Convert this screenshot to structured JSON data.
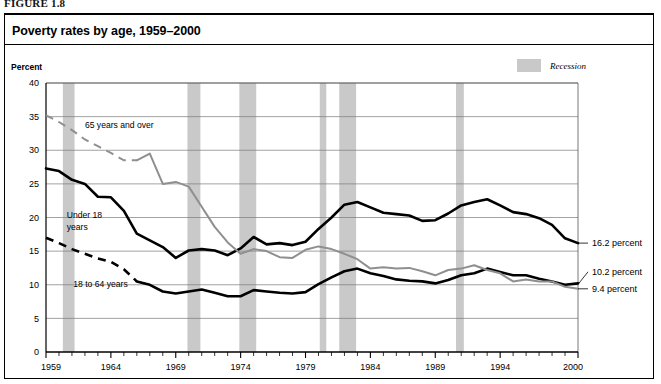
{
  "figure": {
    "label": "FIGURE 1.8"
  },
  "chart_panel": {
    "title": "Poverty rates by age, 1959–2000",
    "y_axis_title": "Percent",
    "legend": {
      "swatch_color": "#c9c9c9",
      "label": "Recession"
    }
  },
  "chart_data": {
    "type": "line",
    "title": "Poverty rates by age, 1959–2000",
    "xlabel": "",
    "ylabel": "Percent",
    "xlim": [
      1959,
      2000
    ],
    "ylim": [
      0,
      40
    ],
    "ytick_labels": [
      "0",
      "5",
      "10",
      "15",
      "20",
      "25",
      "30",
      "35",
      "40"
    ],
    "yticks": [
      0,
      5,
      10,
      15,
      20,
      25,
      30,
      35,
      40
    ],
    "xtick_labels": [
      "1959",
      "1964",
      "1969",
      "1974",
      "1979",
      "1984",
      "1989",
      "1994",
      "2000"
    ],
    "xticks": [
      1959,
      1964,
      1969,
      1974,
      1979,
      1984,
      1989,
      1994,
      2000
    ],
    "minor_xticks_every": 1,
    "grid": "horizontal",
    "legend_position": "top-right",
    "x": [
      1959,
      1960,
      1961,
      1962,
      1963,
      1964,
      1965,
      1966,
      1967,
      1968,
      1969,
      1970,
      1971,
      1972,
      1973,
      1974,
      1975,
      1976,
      1977,
      1978,
      1979,
      1980,
      1981,
      1982,
      1983,
      1984,
      1985,
      1986,
      1987,
      1988,
      1989,
      1990,
      1991,
      1992,
      1993,
      1994,
      1995,
      1996,
      1997,
      1998,
      1999,
      2000
    ],
    "series": [
      {
        "name": "Under 18 years",
        "color": "#000000",
        "style": "solid",
        "end_label": "16.2 percent",
        "values": [
          27.3,
          26.9,
          25.6,
          25.0,
          23.1,
          23.0,
          21.0,
          17.6,
          16.6,
          15.6,
          14.0,
          15.1,
          15.3,
          15.1,
          14.4,
          15.4,
          17.1,
          16.0,
          16.2,
          15.9,
          16.4,
          18.3,
          20.0,
          21.9,
          22.3,
          21.5,
          20.7,
          20.5,
          20.3,
          19.5,
          19.6,
          20.6,
          21.8,
          22.3,
          22.7,
          21.8,
          20.8,
          20.5,
          19.9,
          18.9,
          16.9,
          16.2
        ]
      },
      {
        "name": "18 to 64 years",
        "color": "#000000",
        "style": "dashed-then-solid",
        "solid_from": 1966,
        "end_label": "10.2 percent",
        "values": [
          17.0,
          16.2,
          15.3,
          14.6,
          13.9,
          13.4,
          12.3,
          10.5,
          10.0,
          9.0,
          8.7,
          9.0,
          9.3,
          8.8,
          8.3,
          8.3,
          9.2,
          9.0,
          8.8,
          8.7,
          8.9,
          10.1,
          11.1,
          12.0,
          12.4,
          11.7,
          11.3,
          10.8,
          10.6,
          10.5,
          10.2,
          10.7,
          11.4,
          11.7,
          12.4,
          11.9,
          11.4,
          11.4,
          10.9,
          10.5,
          10.0,
          10.2
        ]
      },
      {
        "name": "65 years and over",
        "color": "#8f8f8f",
        "style": "dashed-then-solid",
        "solid_from": 1966,
        "end_label": "9.4 percent",
        "values": [
          35.2,
          34.2,
          33.0,
          31.6,
          30.6,
          29.6,
          28.5,
          28.5,
          29.5,
          25.0,
          25.3,
          24.6,
          21.6,
          18.6,
          16.3,
          14.6,
          15.3,
          15.0,
          14.1,
          14.0,
          15.2,
          15.7,
          15.3,
          14.6,
          13.8,
          12.4,
          12.6,
          12.4,
          12.5,
          12.0,
          11.4,
          12.2,
          12.4,
          12.9,
          12.2,
          11.7,
          10.5,
          10.8,
          10.5,
          10.5,
          9.7,
          9.4
        ]
      }
    ],
    "recessions": [
      {
        "start": 1960.3,
        "end": 1961.2
      },
      {
        "start": 1969.9,
        "end": 1970.9
      },
      {
        "start": 1973.9,
        "end": 1975.2
      },
      {
        "start": 1980.1,
        "end": 1980.6
      },
      {
        "start": 1981.6,
        "end": 1982.9
      },
      {
        "start": 1990.6,
        "end": 1991.2
      }
    ],
    "annotations": [
      {
        "text": "65 years and over",
        "x": 1962.0,
        "y": 33.3
      },
      {
        "text": "Under 18",
        "x": 1960.6,
        "y": 20.0
      },
      {
        "text": "years",
        "x": 1960.6,
        "y": 18.2
      },
      {
        "text": "18 to 64 years",
        "x": 1961.1,
        "y": 9.6
      }
    ]
  }
}
